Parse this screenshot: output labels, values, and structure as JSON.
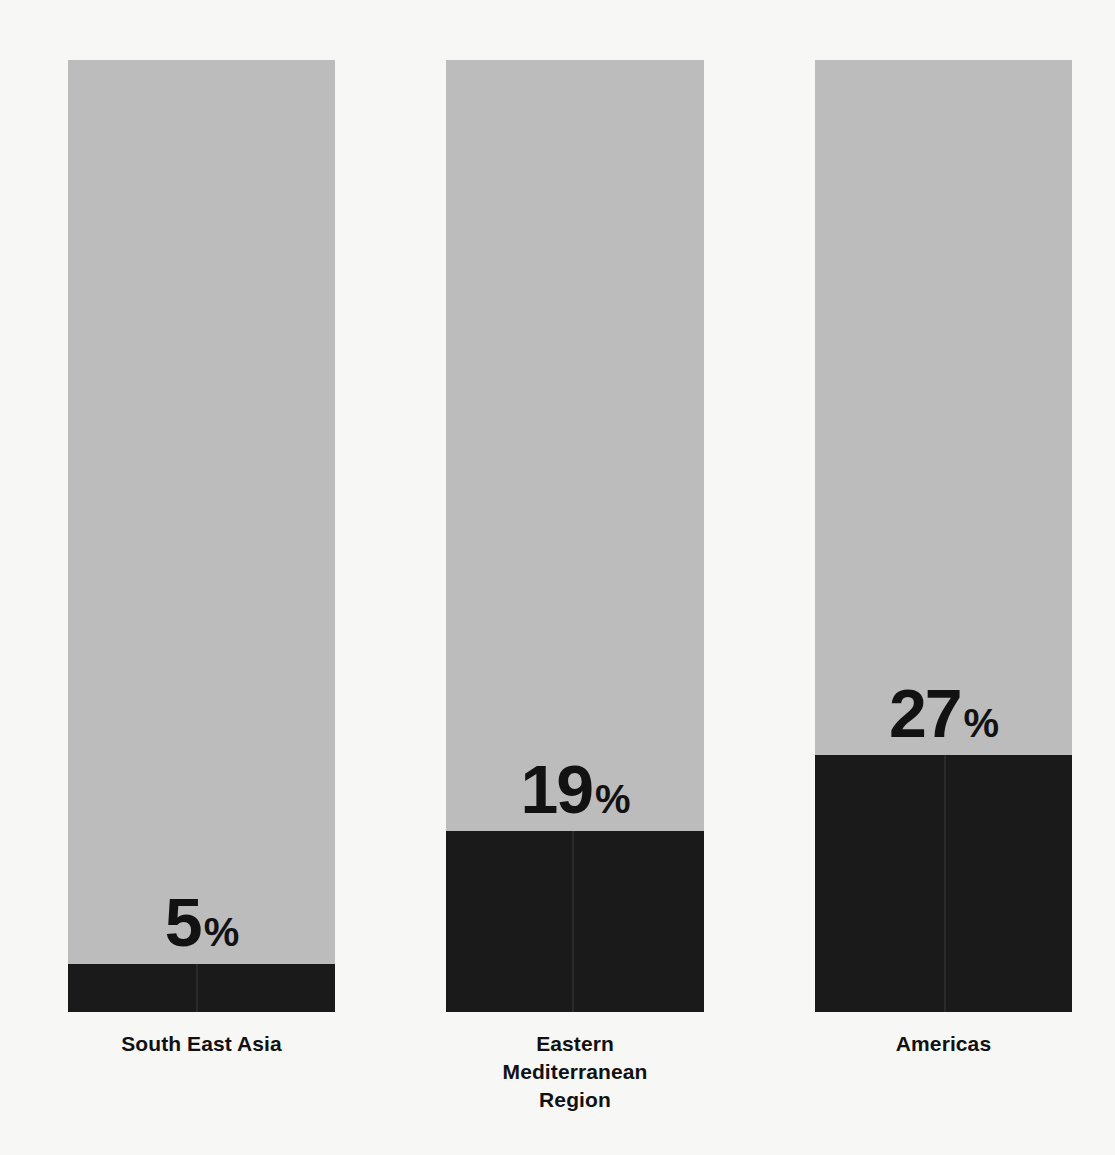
{
  "chart_data": {
    "type": "bar",
    "subtype": "stacked-percentage",
    "title": "",
    "subtitle": "",
    "xlabel": "",
    "ylabel": "",
    "ylim": [
      0,
      100
    ],
    "grid": false,
    "legend": "none",
    "orientation": "vertical",
    "stacked": true,
    "units": "%",
    "categories": [
      "South East Asia",
      "Eastern Mediterranean Region",
      "Americas"
    ],
    "series": [
      {
        "name": "Highlighted share",
        "color": "#1a1a1a",
        "values": [
          5,
          19,
          27
        ]
      },
      {
        "name": "Remainder",
        "color": "#bcbcbc",
        "values": [
          95,
          81,
          73
        ]
      }
    ],
    "data_labels": [
      "5%",
      "19%",
      "27%"
    ],
    "annotations": []
  },
  "colors": {
    "background": "#f7f7f5",
    "track": "#bcbcbc",
    "fill": "#1a1a1a",
    "label_text": "#111111",
    "value_text": "#121212"
  },
  "bars": [
    {
      "category": "South East Asia",
      "category_lines": [
        "South East Asia"
      ],
      "value": 5,
      "value_number": "5",
      "percent_symbol": "%",
      "value_label": "5%"
    },
    {
      "category": "Eastern Mediterranean Region",
      "category_lines": [
        "Eastern",
        "Mediterranean",
        "Region"
      ],
      "value": 19,
      "value_number": "19",
      "percent_symbol": "%",
      "value_label": "19%"
    },
    {
      "category": "Americas",
      "category_lines": [
        "Americas"
      ],
      "value": 27,
      "value_number": "27",
      "percent_symbol": "%",
      "value_label": "27%"
    }
  ]
}
